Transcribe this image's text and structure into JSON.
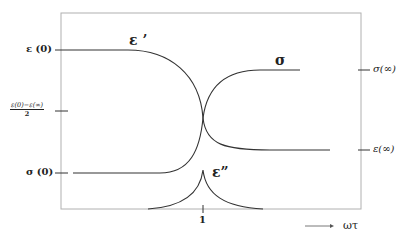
{
  "diagram": {
    "left_axis_labels": {
      "eps_zero": "ε (0)",
      "half_numerator": "ε(0)−ε(∞)",
      "half_denominator": "2",
      "sigma_zero": "σ (0)"
    },
    "right_axis_labels": {
      "sigma_inf": "σ(∞)",
      "eps_inf": "ε(∞)"
    },
    "curve_labels": {
      "eps_real": "ε ’",
      "sigma": "σ",
      "eps_imag": "ε”"
    },
    "x_axis": {
      "tick_label": "1",
      "arrow_label": "ωτ"
    },
    "colors": {
      "curve": "#333333",
      "frame": "#b0b0b0",
      "background": "#ffffff"
    }
  }
}
